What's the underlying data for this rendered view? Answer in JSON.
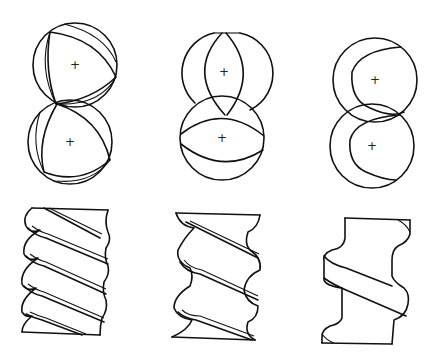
{
  "figure": {
    "description": "Screw rotor configurations: cross-sections of meshing rotor pairs (top row) and corresponding helical rotor side views (bottom row)",
    "background": "#ffffff",
    "line_color": "#111111",
    "center_mark": "+",
    "columns": [
      {
        "id": "three-lobe",
        "lobes": 3,
        "cross_section": {
          "top_rotor_center": [
            75,
            65
          ],
          "bottom_rotor_center": [
            70,
            142
          ],
          "radius": 42,
          "center_labels": [
            "+",
            "+"
          ]
        },
        "side_view": {
          "thread_turns": 4.5,
          "profile": "tight helix"
        }
      },
      {
        "id": "two-lobe",
        "lobes": 2,
        "cross_section": {
          "top_rotor_center": [
            224,
            72
          ],
          "bottom_rotor_center": [
            222,
            138
          ],
          "radius": 42,
          "center_labels": [
            "+",
            "+"
          ]
        },
        "side_view": {
          "thread_turns": 3,
          "profile": "medium helix"
        }
      },
      {
        "id": "one-lobe",
        "lobes": 1,
        "cross_section": {
          "top_rotor_center": [
            375,
            80
          ],
          "bottom_rotor_center": [
            372,
            146
          ],
          "radius": 42,
          "center_labels": [
            "+",
            "+"
          ]
        },
        "side_view": {
          "thread_turns": 1,
          "profile": "single helix"
        }
      }
    ]
  }
}
